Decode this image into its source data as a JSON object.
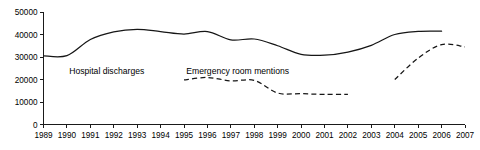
{
  "chart_data": {
    "type": "line",
    "title": "",
    "xlabel": "",
    "ylabel": "",
    "xlim": [
      1989,
      2007
    ],
    "ylim": [
      0,
      50000
    ],
    "grid": false,
    "legend_position": "inline-annotations",
    "x": [
      1989,
      1990,
      1991,
      1992,
      1993,
      1994,
      1995,
      1996,
      1997,
      1998,
      1999,
      2000,
      2001,
      2002,
      2003,
      2004,
      2005,
      2006,
      2007
    ],
    "y_ticks": [
      0,
      10000,
      20000,
      30000,
      40000,
      50000
    ],
    "y_tick_labels": [
      "0",
      "10000",
      "20000",
      "30000",
      "40000",
      "50000"
    ],
    "x_ticks": [
      1989,
      1990,
      1991,
      1992,
      1993,
      1994,
      1995,
      1996,
      1997,
      1998,
      1999,
      2000,
      2001,
      2002,
      2003,
      2004,
      2005,
      2006,
      2007
    ],
    "x_tick_labels": [
      "1989",
      "1990",
      "1991",
      "1992",
      "1993",
      "1994",
      "1995",
      "1996",
      "1997",
      "1998",
      "1999",
      "2000",
      "2001",
      "2002",
      "2003",
      "2004",
      "2005",
      "2006",
      "2007"
    ],
    "series": [
      {
        "name": "Hospital discharges",
        "style": "solid",
        "color": "#161616",
        "x": [
          1989,
          1990,
          1991,
          1992,
          1993,
          1994,
          1995,
          1996,
          1997,
          1998,
          1999,
          2000,
          2001,
          2002,
          2003,
          2004,
          2005,
          2006
        ],
        "values": [
          30500,
          30600,
          37800,
          41200,
          42300,
          41300,
          40200,
          41300,
          37600,
          38000,
          35000,
          31200,
          30800,
          32200,
          35200,
          40000,
          41400,
          41500
        ]
      },
      {
        "name": "Emergency room mentions",
        "style": "dashed",
        "color": "#161616",
        "segments": [
          {
            "x": [
              1995,
              1996,
              1997,
              1998,
              1999,
              2000,
              2001,
              2002
            ],
            "values": [
              19800,
              20900,
              19400,
              19600,
              14000,
              13700,
              13400,
              13400
            ]
          },
          {
            "x": [
              2004,
              2005,
              2006,
              2007
            ],
            "values": [
              20000,
              29500,
              35500,
              34500
            ]
          }
        ]
      }
    ],
    "annotations": [
      {
        "text": "Hospital discharges",
        "x": 1990.1,
        "y": 22600
      },
      {
        "text": "Emergency room mentions",
        "x": 1995.1,
        "y": 22600
      }
    ]
  }
}
